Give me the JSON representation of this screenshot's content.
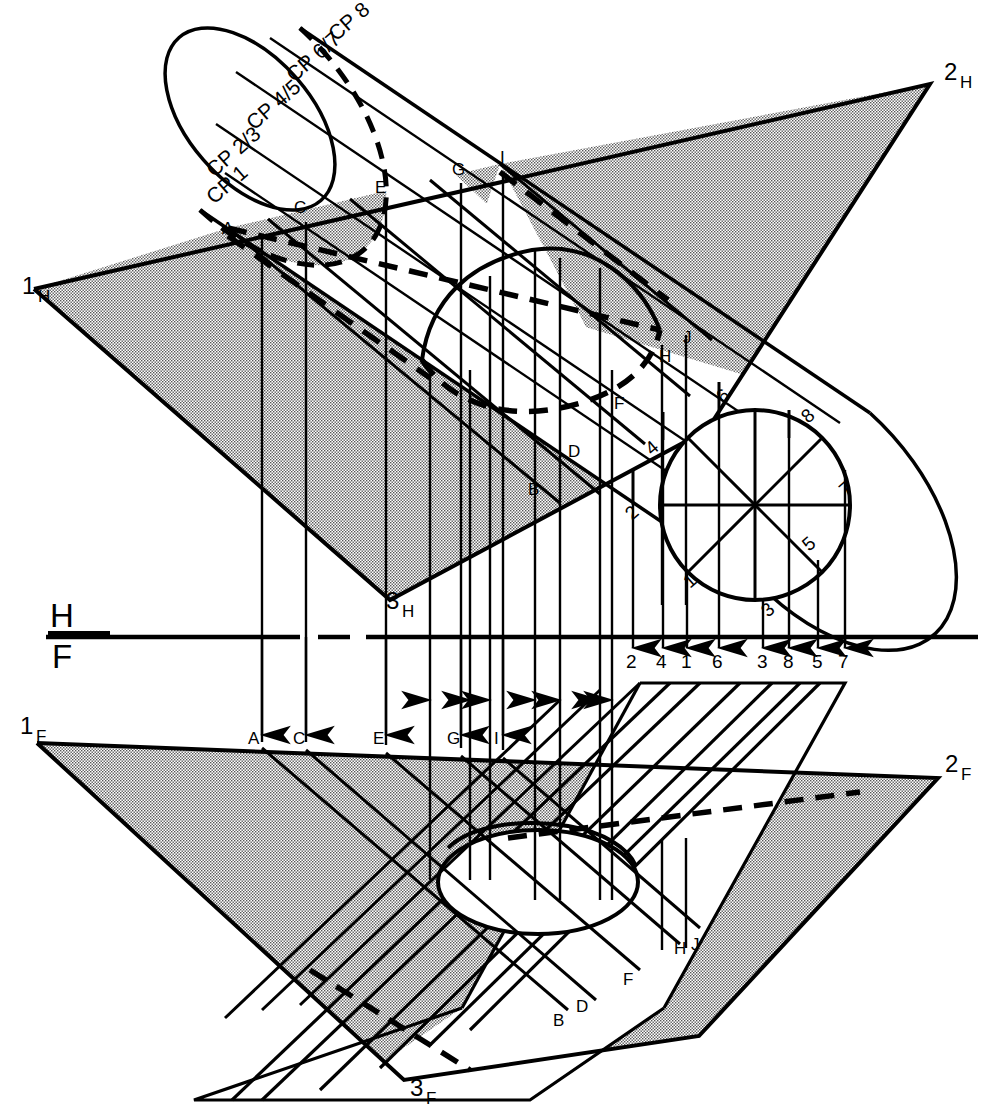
{
  "drawing": {
    "title": "Intersection of a plane and an oblique cylinder — H and F views",
    "stroke_color": "#000000",
    "fill_tone": "#c9c9c9",
    "background": "#ffffff"
  },
  "fold_line": {
    "upper_label": "H",
    "lower_label": "F",
    "name": "H/F reference line"
  },
  "h_view": {
    "plane_corner_labels": [
      {
        "id": "1H",
        "num": "1",
        "sub": "H",
        "x": 22,
        "y": 294
      },
      {
        "id": "2H",
        "num": "2",
        "sub": "H",
        "x": 946,
        "y": 78
      },
      {
        "id": "3H",
        "num": "3",
        "sub": "H",
        "x": 388,
        "y": 607
      }
    ],
    "point_labels": [
      {
        "text": "A",
        "x": 224,
        "y": 231
      },
      {
        "text": "C",
        "x": 296,
        "y": 210
      },
      {
        "text": "E",
        "x": 377,
        "y": 190
      },
      {
        "text": "G",
        "x": 455,
        "y": 172
      },
      {
        "text": "I",
        "x": 501,
        "y": 160
      },
      {
        "text": "B",
        "x": 533,
        "y": 491
      },
      {
        "text": "D",
        "x": 572,
        "y": 453
      },
      {
        "text": "F",
        "x": 618,
        "y": 405
      },
      {
        "text": "H",
        "x": 663,
        "y": 358
      },
      {
        "text": "J",
        "x": 686,
        "y": 339
      }
    ],
    "cutting_plane_labels": [
      {
        "text": "CP 1",
        "x": 214,
        "y": 205,
        "rot": -41
      },
      {
        "text": "CP 2/3",
        "x": 216,
        "y": 178,
        "rot": -41
      },
      {
        "text": "CP 4/5",
        "x": 258,
        "y": 130,
        "rot": -41
      },
      {
        "text": "CP 6/7",
        "x": 297,
        "y": 82,
        "rot": -41
      },
      {
        "text": "CP 8",
        "x": 337,
        "y": 40,
        "rot": -41
      }
    ],
    "circle_point_labels": [
      {
        "text": "1",
        "x": 694,
        "y": 585
      },
      {
        "text": "2",
        "x": 637,
        "y": 516
      },
      {
        "text": "3",
        "x": 772,
        "y": 614
      },
      {
        "text": "4",
        "x": 657,
        "y": 451
      },
      {
        "text": "5",
        "x": 813,
        "y": 547
      },
      {
        "text": "6",
        "x": 727,
        "y": 400
      },
      {
        "text": "7",
        "x": 850,
        "y": 492
      },
      {
        "text": "8",
        "x": 812,
        "y": 419
      }
    ]
  },
  "fold_numbers": {
    "labels": [
      "2",
      "4",
      "1",
      "6",
      "3",
      "8",
      "5",
      "7"
    ],
    "x": [
      633,
      663,
      687,
      719,
      763,
      789,
      818,
      844
    ],
    "y": 668
  },
  "f_view": {
    "plane_corner_labels": [
      {
        "id": "1F",
        "num": "1",
        "sub": "F",
        "x": 22,
        "y": 731
      },
      {
        "id": "2F",
        "num": "2",
        "sub": "F",
        "x": 947,
        "y": 769
      },
      {
        "id": "3F",
        "num": "3",
        "sub": "F",
        "x": 412,
        "y": 1092
      }
    ],
    "point_labels": [
      {
        "text": "A",
        "x": 251,
        "y": 743
      },
      {
        "text": "C",
        "x": 297,
        "y": 743
      },
      {
        "text": "E",
        "x": 378,
        "y": 743
      },
      {
        "text": "G",
        "x": 451,
        "y": 743
      },
      {
        "text": "I",
        "x": 495,
        "y": 743
      },
      {
        "text": "B",
        "x": 557,
        "y": 1022
      },
      {
        "text": "D",
        "x": 580,
        "y": 1009
      },
      {
        "text": "F",
        "x": 627,
        "y": 981
      },
      {
        "text": "H",
        "x": 679,
        "y": 950
      },
      {
        "text": "J",
        "x": 694,
        "y": 947
      }
    ]
  }
}
